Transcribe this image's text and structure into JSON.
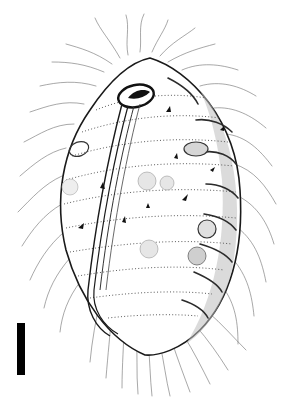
{
  "figure": {
    "style": "pen-and-ink line drawing",
    "background_color": "#ffffff",
    "ink_color": "#1a1a1a",
    "body": {
      "cx": 152,
      "cy": 200,
      "rx": 92,
      "ry": 150
    },
    "scale_bar": {
      "x": 17,
      "y": 323,
      "width": 8,
      "height": 52,
      "color": "#000000"
    }
  }
}
